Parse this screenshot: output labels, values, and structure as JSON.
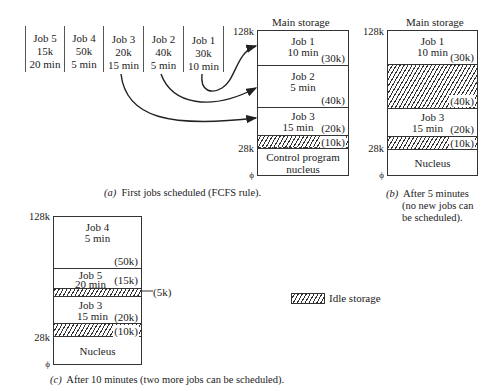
{
  "job_queue": [
    {
      "name": "Job 5",
      "size": "15k",
      "time": "20 min"
    },
    {
      "name": "Job 4",
      "size": "50k",
      "time": "5 min"
    },
    {
      "name": "Job 3",
      "size": "20k",
      "time": "15 min"
    },
    {
      "name": "Job 2",
      "size": "40k",
      "time": "5 min"
    },
    {
      "name": "Job 1",
      "size": "30k",
      "time": "10 min"
    }
  ],
  "panel_a": {
    "title": "Main storage",
    "top_label": "128k",
    "nucleus_label": "28k",
    "bottom_label": "ϕ",
    "segments": [
      {
        "name": "Job 1",
        "time": "10 min",
        "size": "(30k)"
      },
      {
        "name": "Job 2",
        "time": "5 min",
        "size": "(40k)"
      },
      {
        "name": "Job 3",
        "time": "15 min",
        "size": "(20k)"
      },
      {
        "name": "",
        "time": "",
        "size": "(10k)",
        "idle": true
      },
      {
        "name": "Control program",
        "time": "nucleus",
        "size": ""
      }
    ],
    "caption_prefix": "(a)",
    "caption": "First jobs scheduled (FCFS rule)."
  },
  "panel_b": {
    "title": "Main storage",
    "top_label": "128k",
    "nucleus_label": "28k",
    "bottom_label": "ϕ",
    "segments": [
      {
        "name": "Job 1",
        "time": "10 min",
        "size": "(30k)"
      },
      {
        "name": "",
        "time": "",
        "size": "(40k)",
        "idle": true
      },
      {
        "name": "Job 3",
        "time": "15 min",
        "size": "(20k)"
      },
      {
        "name": "",
        "time": "",
        "size": "(10k)",
        "idle": true
      },
      {
        "name": "Nucleus",
        "time": "",
        "size": ""
      }
    ],
    "caption_prefix": "(b)",
    "caption_lines": [
      "After 5 minutes",
      "(no new jobs can",
      "be scheduled)."
    ]
  },
  "panel_c": {
    "top_label": "128k",
    "nucleus_label": "28k",
    "bottom_label": "ϕ",
    "segments": [
      {
        "name": "Job 4",
        "time": "5 min",
        "size": "(50k)"
      },
      {
        "name": "Job 5",
        "time": "20 min",
        "size": "(15k)"
      },
      {
        "name": "",
        "time": "",
        "size": "(5k)",
        "idle": true
      },
      {
        "name": "Job 3",
        "time": "15 min",
        "size": "(20k)"
      },
      {
        "name": "",
        "time": "",
        "size": "(10k)",
        "idle": true
      },
      {
        "name": "Nucleus",
        "time": "",
        "size": ""
      }
    ],
    "caption_prefix": "(c)",
    "caption": "After 10 minutes (two more jobs can be scheduled)."
  },
  "legend": {
    "label": "Idle storage"
  },
  "colors": {
    "line": "#333333",
    "text": "#222222",
    "background": "#ffffff"
  }
}
